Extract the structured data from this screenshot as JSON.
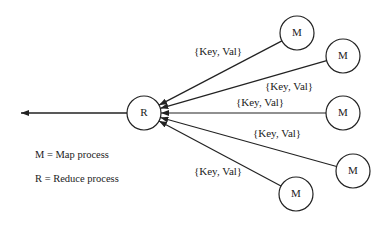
{
  "diagram": {
    "reducer": {
      "label": "R",
      "cx": 144,
      "cy": 113,
      "r": 17
    },
    "output_arrow": {
      "x1": 127,
      "y1": 113,
      "x2": 21,
      "y2": 113
    },
    "mappers": [
      {
        "label": "M",
        "cx": 297,
        "cy": 33,
        "r": 17
      },
      {
        "label": "M",
        "cx": 343,
        "cy": 56,
        "r": 17
      },
      {
        "label": "M",
        "cx": 343,
        "cy": 113,
        "r": 17
      },
      {
        "label": "M",
        "cx": 353,
        "cy": 171,
        "r": 17
      },
      {
        "label": "M",
        "cx": 296,
        "cy": 194,
        "r": 17
      }
    ],
    "edge_labels": [
      {
        "text": "{Key, Val}",
        "x": 194,
        "y": 46
      },
      {
        "text": "{Key, Val}",
        "x": 265,
        "y": 81
      },
      {
        "text": "{Key, Val}",
        "x": 236,
        "y": 97
      },
      {
        "text": "{Key, Val}",
        "x": 253,
        "y": 128
      },
      {
        "text": "{Key, Val}",
        "x": 194,
        "y": 166
      }
    ],
    "legend": [
      {
        "text": "M = Map process",
        "y": 150
      },
      {
        "text": "R = Reduce process",
        "y": 174
      }
    ],
    "stroke_color": "#222222"
  }
}
